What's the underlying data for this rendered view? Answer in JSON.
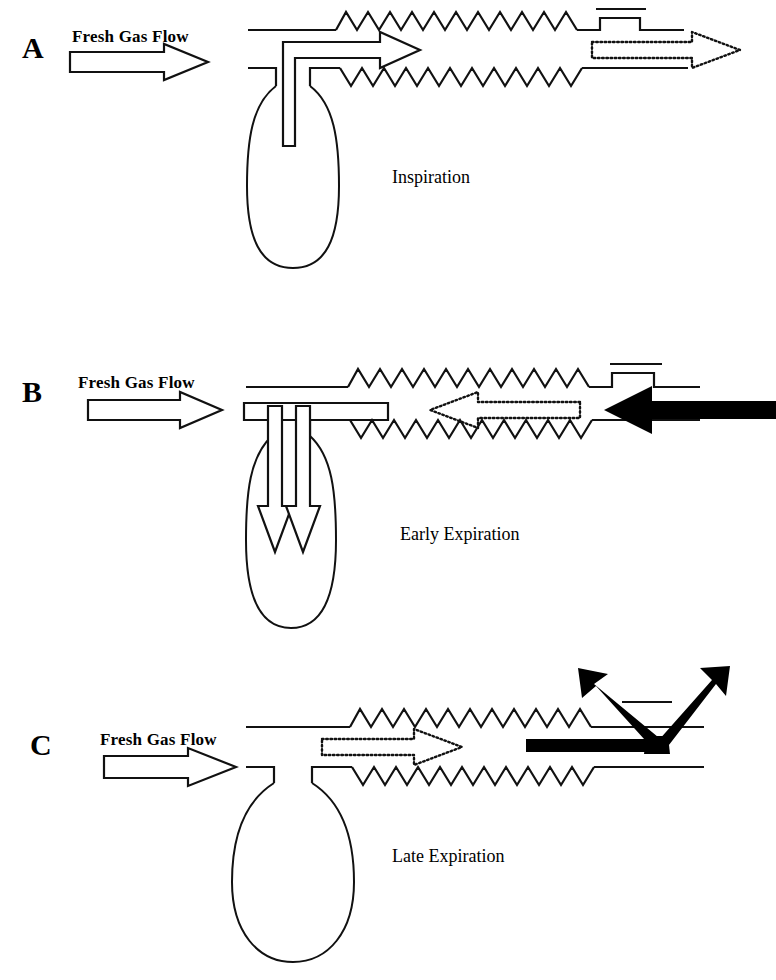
{
  "figure": {
    "background_color": "#ffffff",
    "line_color": "#111111"
  },
  "panels": [
    {
      "letter": "A",
      "fresh_gas_label": "Fresh Gas Flow",
      "phase_label": "Inspiration",
      "bag_state": "partially deflated",
      "apl_valve_state": "closed",
      "arrows": [
        {
          "name": "fresh-gas-flow-arrow",
          "style": "hollow-outline",
          "direction": "right"
        },
        {
          "name": "inspiratory-flow-arrow",
          "style": "hollow-outline",
          "direction": "right-from-bag"
        },
        {
          "name": "patient-inflow-arrow",
          "style": "dotted-outline",
          "direction": "right"
        }
      ]
    },
    {
      "letter": "B",
      "fresh_gas_label": "Fresh Gas Flow",
      "phase_label": "Early Expiration",
      "bag_state": "refilling",
      "apl_valve_state": "closed",
      "arrows": [
        {
          "name": "fresh-gas-flow-arrow",
          "style": "hollow-outline",
          "direction": "right"
        },
        {
          "name": "fresh-gas-into-bag-arrow",
          "style": "hollow-outline",
          "direction": "down"
        },
        {
          "name": "expired-gas-into-bag-arrow",
          "style": "hollow-outline",
          "direction": "down"
        },
        {
          "name": "expired-gas-arrow",
          "style": "dotted-outline",
          "direction": "left"
        },
        {
          "name": "patient-expiration-arrow",
          "style": "solid-black",
          "direction": "left"
        }
      ]
    },
    {
      "letter": "C",
      "fresh_gas_label": "Fresh Gas Flow",
      "phase_label": "Late Expiration",
      "bag_state": "full / distended",
      "apl_valve_state": "open (venting)",
      "arrows": [
        {
          "name": "fresh-gas-flow-arrow",
          "style": "hollow-outline",
          "direction": "right"
        },
        {
          "name": "bag-outflow-arrow",
          "style": "dotted-outline",
          "direction": "right"
        },
        {
          "name": "scavenging-vent-arrow-left",
          "style": "solid-black",
          "direction": "up-left"
        },
        {
          "name": "scavenging-vent-arrow-right",
          "style": "solid-black",
          "direction": "up-right"
        }
      ]
    }
  ]
}
